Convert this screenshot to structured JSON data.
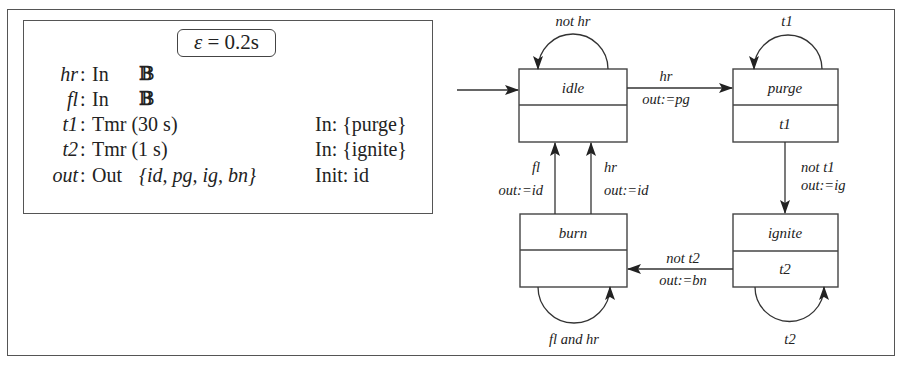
{
  "declarations": {
    "epsilon": {
      "symbol": "ε",
      "equals": "=",
      "value": "0.2s"
    },
    "rows": [
      {
        "name": "hr",
        "colon": ":",
        "type": "In",
        "domain": "𝔹",
        "extra": ""
      },
      {
        "name": "fl",
        "colon": ":",
        "type": "In",
        "domain": "𝔹",
        "extra": ""
      },
      {
        "name": "t1",
        "colon": ":",
        "type": "Tmr (30 s)",
        "domain": "",
        "extra": "In: {purge}"
      },
      {
        "name": "t2",
        "colon": ":",
        "type": "Tmr (1 s)",
        "domain": "",
        "extra": "In: {ignite}"
      },
      {
        "name": "out",
        "colon": ":",
        "type": "Out",
        "domain": "{id, pg, ig, bn}",
        "extra": "Init: id"
      }
    ]
  },
  "states": {
    "idle": {
      "label": "idle",
      "body": ""
    },
    "purge": {
      "label": "purge",
      "body": "t1"
    },
    "ignite": {
      "label": "ignite",
      "body": "t2"
    },
    "burn": {
      "label": "burn",
      "body": ""
    }
  },
  "transitions": {
    "idle_self": {
      "guard": "not hr"
    },
    "idle_purge": {
      "guard": "hr",
      "action": "out:=pg"
    },
    "purge_self": {
      "guard": "t1"
    },
    "purge_ignite": {
      "guard": "not t1",
      "action": "out:=ig"
    },
    "ignite_self": {
      "guard": "t2"
    },
    "ignite_burn": {
      "guard": "not t2",
      "action": "out:=bn"
    },
    "burn_self": {
      "guard": "fl and hr"
    },
    "burn_idle_fl": {
      "guard": "fl",
      "action": "out:=id"
    },
    "burn_idle_hr": {
      "guard": "hr",
      "action": "out:=id"
    }
  }
}
